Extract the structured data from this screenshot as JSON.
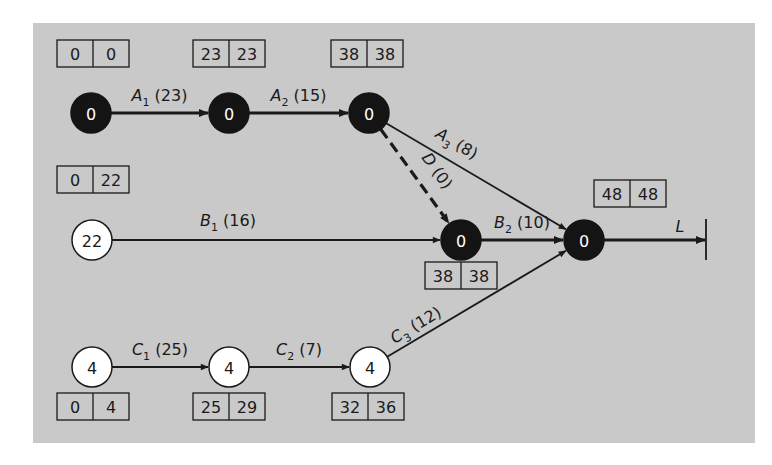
{
  "diagram": {
    "type": "activity-on-arrow network (critical path)",
    "panel_color": "#c9c9c9",
    "critical_node_color": "#141414",
    "normal_node_color": "#ffffff",
    "nodes": [
      {
        "id": "n_a0",
        "x": 91,
        "y": 113,
        "label": "0",
        "critical": true,
        "box": {
          "x": 57,
          "y": 40,
          "left": "0",
          "right": "0"
        }
      },
      {
        "id": "n_a1",
        "x": 229,
        "y": 113,
        "label": "0",
        "critical": true,
        "box": {
          "x": 193,
          "y": 40,
          "left": "23",
          "right": "23"
        }
      },
      {
        "id": "n_a2",
        "x": 369,
        "y": 113,
        "label": "0",
        "critical": true,
        "box": {
          "x": 331,
          "y": 40,
          "left": "38",
          "right": "38"
        }
      },
      {
        "id": "n_b0",
        "x": 92,
        "y": 240,
        "label": "22",
        "critical": false,
        "box": {
          "x": 57,
          "y": 166,
          "left": "0",
          "right": "22"
        }
      },
      {
        "id": "n_d",
        "x": 461,
        "y": 240,
        "label": "0",
        "critical": true,
        "box": {
          "x": 425,
          "y": 262,
          "left": "38",
          "right": "38"
        }
      },
      {
        "id": "n_end",
        "x": 584,
        "y": 240,
        "label": "0",
        "critical": true,
        "box": {
          "x": 594,
          "y": 180,
          "left": "48",
          "right": "48"
        }
      },
      {
        "id": "n_c0",
        "x": 92,
        "y": 367,
        "label": "4",
        "critical": false,
        "box": {
          "x": 57,
          "y": 393,
          "left": "0",
          "right": "4"
        }
      },
      {
        "id": "n_c1",
        "x": 229,
        "y": 367,
        "label": "4",
        "critical": false,
        "box": {
          "x": 193,
          "y": 393,
          "left": "25",
          "right": "29"
        }
      },
      {
        "id": "n_c2",
        "x": 370,
        "y": 367,
        "label": "4",
        "critical": false,
        "box": {
          "x": 332,
          "y": 393,
          "left": "32",
          "right": "36"
        }
      }
    ],
    "edges": [
      {
        "from": "n_a0",
        "to": "n_a1",
        "name": "A",
        "sub": "1",
        "duration": "(23)",
        "style": "crit"
      },
      {
        "from": "n_a1",
        "to": "n_a2",
        "name": "A",
        "sub": "2",
        "duration": "(15)",
        "style": "crit"
      },
      {
        "from": "n_a2",
        "to": "n_end",
        "name": "A",
        "sub": "3",
        "duration": "(8)",
        "style": "norm"
      },
      {
        "from": "n_a2",
        "to": "n_d",
        "name": "D",
        "sub": "",
        "duration": "(0)",
        "style": "dummy"
      },
      {
        "from": "n_b0",
        "to": "n_d",
        "name": "B",
        "sub": "1",
        "duration": "(16)",
        "style": "norm"
      },
      {
        "from": "n_d",
        "to": "n_end",
        "name": "B",
        "sub": "2",
        "duration": "(10)",
        "style": "crit"
      },
      {
        "from": "n_c0",
        "to": "n_c1",
        "name": "C",
        "sub": "1",
        "duration": "(25)",
        "style": "norm"
      },
      {
        "from": "n_c1",
        "to": "n_c2",
        "name": "C",
        "sub": "2",
        "duration": "(7)",
        "style": "norm"
      },
      {
        "from": "n_c2",
        "to": "n_end",
        "name": "C",
        "sub": "3",
        "duration": "(12)",
        "style": "norm"
      }
    ],
    "terminal": {
      "from": "n_end",
      "x": 706,
      "name": "L",
      "style": "crit"
    }
  }
}
